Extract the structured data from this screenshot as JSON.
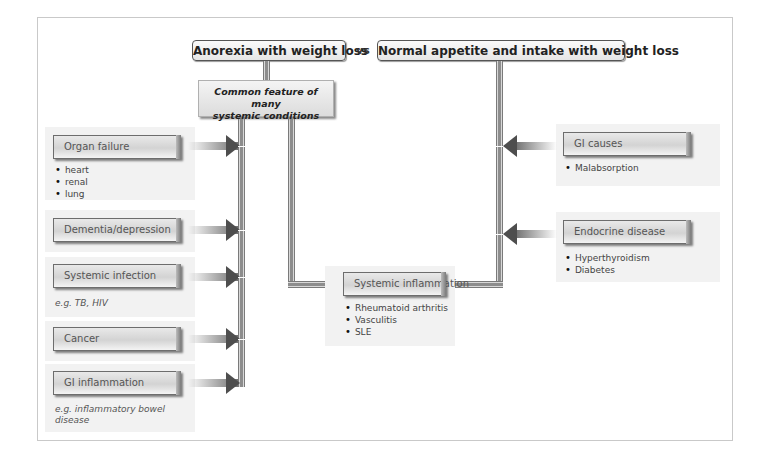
{
  "header": {
    "left_title": "Anorexia with weight loss",
    "vs_label": "vs",
    "right_title": "Normal appetite and intake with weight loss"
  },
  "feature_box": {
    "line1": "Common feature of many",
    "line2": "systemic conditions"
  },
  "left_causes": [
    {
      "label": "Organ failure",
      "bullets": [
        "heart",
        "renal",
        "lung"
      ]
    },
    {
      "label": "Dementia/depression"
    },
    {
      "label": "Systemic infection",
      "note": "e.g. TB, HIV"
    },
    {
      "label": "Cancer"
    },
    {
      "label": "GI inflammation",
      "note_line1": "e.g. inflammatory bowel",
      "note_line2": "disease"
    }
  ],
  "center_cause": {
    "label": "Systemic inflammation",
    "bullets": [
      "Rheumatoid arthritis",
      "Vasculitis",
      "SLE"
    ]
  },
  "right_causes": [
    {
      "label": "GI causes",
      "bullets": [
        "Malabsorption"
      ]
    },
    {
      "label": "Endocrine disease",
      "bullets": [
        "Hyperthyroidism",
        "Diabetes"
      ]
    }
  ],
  "colors": {
    "panel_bg": "#f2f2f2",
    "arrow": "#4e4e4e",
    "pipe": "#8d8d8d"
  }
}
